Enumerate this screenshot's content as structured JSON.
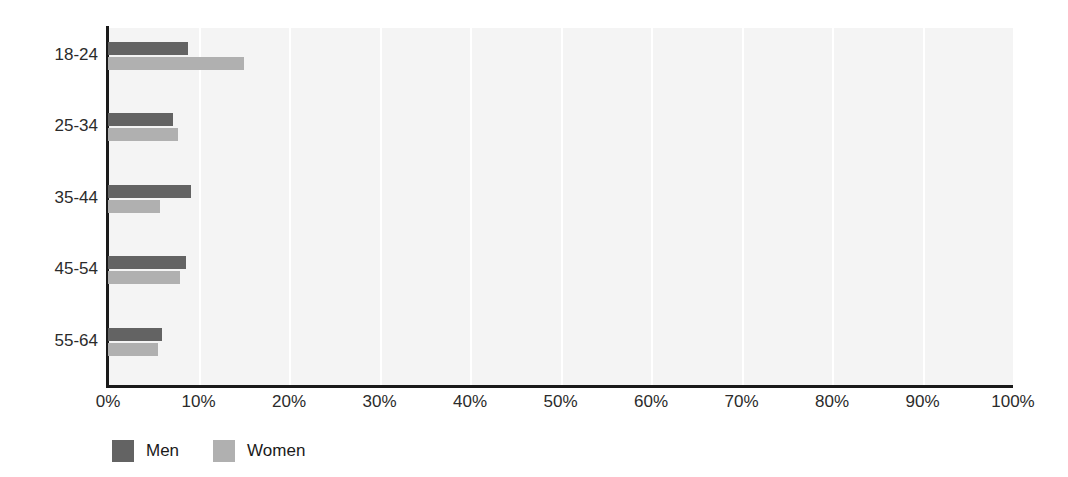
{
  "chart_data": {
    "type": "bar",
    "orientation": "horizontal",
    "title": "",
    "xlabel": "",
    "ylabel": "",
    "categories": [
      "18-24",
      "25-34",
      "35-44",
      "45-54",
      "55-64"
    ],
    "series": [
      {
        "name": "Men",
        "color": "#636363",
        "values": [
          8.8,
          7.2,
          9.2,
          8.6,
          6.0
        ]
      },
      {
        "name": "Women",
        "color": "#b0b0b0",
        "values": [
          15.0,
          7.7,
          5.7,
          8.0,
          5.5
        ]
      }
    ],
    "xlim": [
      0,
      100
    ],
    "xticks": [
      0,
      10,
      20,
      30,
      40,
      50,
      60,
      70,
      80,
      90,
      100
    ],
    "xtick_labels": [
      "0%",
      "10%",
      "20%",
      "30%",
      "40%",
      "50%",
      "60%",
      "70%",
      "80%",
      "90%",
      "100%"
    ],
    "grid": "vertical",
    "legend_position": "bottom-left",
    "plot_background": "#f4f4f4",
    "gridline_color": "#ffffff",
    "axis_color": "#1a1a1a"
  },
  "legend": {
    "items": [
      {
        "label": "Men"
      },
      {
        "label": "Women"
      }
    ]
  }
}
